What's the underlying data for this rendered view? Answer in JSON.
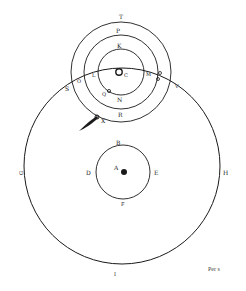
{
  "diagram": {
    "colors": {
      "ink": "#1a1a1a",
      "paper": "#ffffff"
    },
    "upper_system": {
      "center_label": "C",
      "labels": {
        "outer_top": "T",
        "middle_top": "P",
        "inner_top": "K",
        "inner_bottom": "N",
        "middle_bottom": "R",
        "outer_bottom": "X",
        "left_outer": "S",
        "left_middle": "O",
        "left_inner": "L",
        "right_inner": "M",
        "right_outer": "V",
        "lower_left_symbol": "Q"
      }
    },
    "lower_system": {
      "center_label": "A",
      "labels": {
        "top": "B",
        "left": "D",
        "right": "E",
        "bottom": "F"
      }
    },
    "large_circle": {
      "labels": {
        "left": "G",
        "right": "H",
        "bottom": "I"
      }
    },
    "caption": "Per s"
  }
}
